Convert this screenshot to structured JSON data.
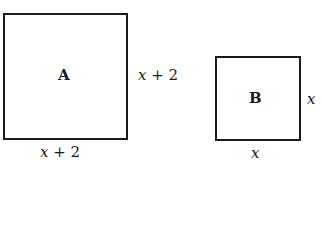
{
  "squares": [
    {
      "name": "A",
      "side_label": {
        "var": "x",
        "rest": " + 2"
      },
      "bottom_label": {
        "var": "x",
        "rest": " + 2"
      }
    },
    {
      "name": "B",
      "side_label": {
        "var": "x",
        "rest": ""
      },
      "bottom_label": {
        "var": "x",
        "rest": ""
      }
    }
  ]
}
